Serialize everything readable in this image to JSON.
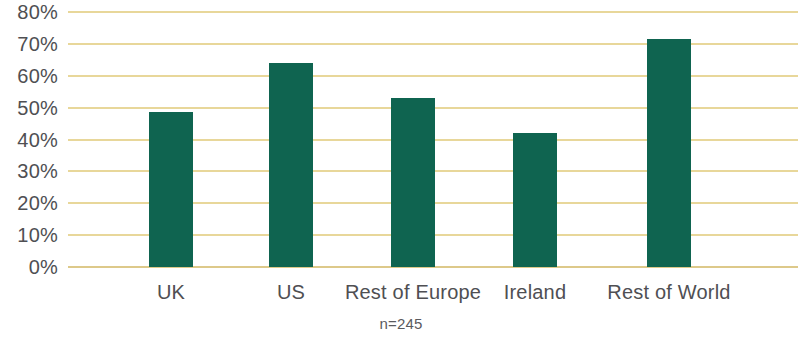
{
  "chart_data": {
    "type": "bar",
    "title": "",
    "subtitle": "",
    "xlabel": "",
    "ylabel": "",
    "categories": [
      "UK",
      "US",
      "Rest of Europe",
      "Ireland",
      "Rest of World"
    ],
    "values": [
      48.5,
      64,
      53,
      42,
      71.5
    ],
    "value_labels": [
      "48.5%",
      "64%",
      "53%",
      "42%",
      "71.5%"
    ],
    "ylim": [
      0,
      80
    ],
    "y_ticks": [
      0,
      10,
      20,
      30,
      40,
      50,
      60,
      70,
      80
    ],
    "y_tick_labels": [
      "0%",
      "10%",
      "20%",
      "30%",
      "40%",
      "50%",
      "60%",
      "70%",
      "80%"
    ],
    "grid": true,
    "grid_axis": "y",
    "legend": false,
    "legend_position": "none",
    "series": [
      {
        "name": "",
        "color": "#0f6450",
        "values": [
          48.5,
          64,
          53,
          42,
          71.5
        ]
      }
    ],
    "annotations": [
      {
        "text": "n=245",
        "position": "below-axis-center"
      }
    ],
    "colors": {
      "bar": "#0f6450",
      "gridline": "#e8d79a",
      "baseline": "#ddc98a",
      "tick_label": "#4f4f53",
      "annotation": "#5a5a5e",
      "background": "#ffffff"
    }
  },
  "footnote": {
    "text": "n=245"
  }
}
